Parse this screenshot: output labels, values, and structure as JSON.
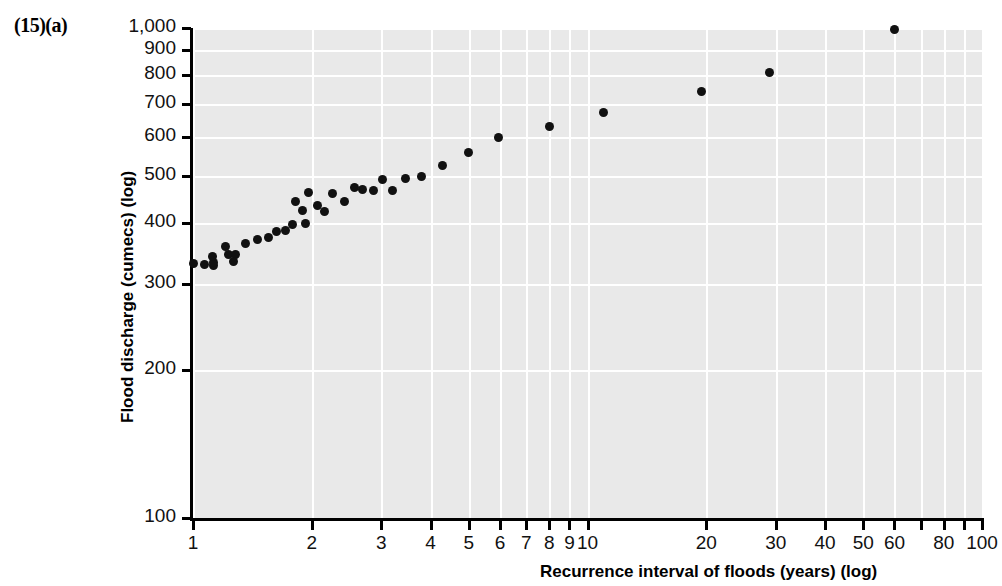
{
  "figure": {
    "panel_label": "(15)(a)",
    "background_color": "#e9e9e9",
    "grid_color": "#ffffff",
    "marker_color": "#111111"
  },
  "chart_data": {
    "type": "scatter",
    "title": "",
    "xlabel": "Recurrence interval of floods (years) (log)",
    "ylabel": "Flood discharge (cumecs) (log)",
    "xscale": "log",
    "yscale": "log",
    "xlim": [
      1,
      100
    ],
    "ylim": [
      100,
      1000
    ],
    "grid": true,
    "legend": "none",
    "xticks": [
      1,
      2,
      3,
      4,
      5,
      6,
      7,
      8,
      9,
      10,
      20,
      30,
      40,
      50,
      60,
      70,
      80,
      90,
      100
    ],
    "xticklabels": [
      "1",
      "2",
      "3",
      "4",
      "5",
      "6",
      "7",
      "8",
      "9",
      "10",
      "20",
      "30",
      "40",
      "50",
      "60",
      "",
      "80",
      "",
      "100"
    ],
    "yticks": [
      100,
      200,
      300,
      400,
      500,
      600,
      700,
      800,
      900,
      1000
    ],
    "yticklabels": [
      "100",
      "200",
      "300",
      "400",
      "500",
      "600",
      "700",
      "800",
      "900",
      "1,000"
    ],
    "series": [
      {
        "name": "Annual maximum flood series",
        "marker": "circle",
        "points": [
          {
            "x": 1.0,
            "y": 330
          },
          {
            "x": 1.07,
            "y": 329
          },
          {
            "x": 1.13,
            "y": 327
          },
          {
            "x": 1.13,
            "y": 333
          },
          {
            "x": 1.12,
            "y": 341
          },
          {
            "x": 1.21,
            "y": 359
          },
          {
            "x": 1.23,
            "y": 345
          },
          {
            "x": 1.28,
            "y": 345
          },
          {
            "x": 1.27,
            "y": 334
          },
          {
            "x": 1.36,
            "y": 364
          },
          {
            "x": 1.46,
            "y": 370
          },
          {
            "x": 1.55,
            "y": 373
          },
          {
            "x": 1.63,
            "y": 384
          },
          {
            "x": 1.72,
            "y": 386
          },
          {
            "x": 1.79,
            "y": 397
          },
          {
            "x": 1.82,
            "y": 443
          },
          {
            "x": 1.89,
            "y": 424
          },
          {
            "x": 1.93,
            "y": 399
          },
          {
            "x": 1.96,
            "y": 462
          },
          {
            "x": 2.07,
            "y": 435
          },
          {
            "x": 2.16,
            "y": 423
          },
          {
            "x": 2.26,
            "y": 459
          },
          {
            "x": 2.42,
            "y": 442
          },
          {
            "x": 2.56,
            "y": 472
          },
          {
            "x": 2.69,
            "y": 469
          },
          {
            "x": 2.86,
            "y": 467
          },
          {
            "x": 3.03,
            "y": 490
          },
          {
            "x": 3.2,
            "y": 465
          },
          {
            "x": 3.45,
            "y": 492
          },
          {
            "x": 3.8,
            "y": 497
          },
          {
            "x": 4.3,
            "y": 524
          },
          {
            "x": 5.0,
            "y": 557
          },
          {
            "x": 5.95,
            "y": 597
          },
          {
            "x": 8.0,
            "y": 628
          },
          {
            "x": 11.0,
            "y": 672
          },
          {
            "x": 19.5,
            "y": 741
          },
          {
            "x": 29.0,
            "y": 813
          },
          {
            "x": 60.0,
            "y": 995
          }
        ]
      }
    ]
  }
}
